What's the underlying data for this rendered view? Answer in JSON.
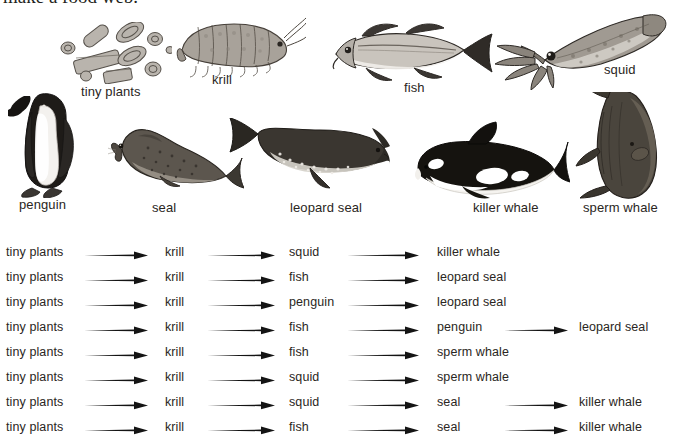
{
  "header": {
    "title": "make a food web."
  },
  "gallery": {
    "name": "antarctic-food-web-organisms",
    "items": [
      {
        "id": "tiny-plants",
        "label": "tiny plants",
        "art": "phytoplankton-diatoms-illustration"
      },
      {
        "id": "krill",
        "label": "krill",
        "art": "krill-illustration"
      },
      {
        "id": "fish",
        "label": "fish",
        "art": "fish-illustration"
      },
      {
        "id": "squid",
        "label": "squid",
        "art": "squid-illustration"
      },
      {
        "id": "penguin",
        "label": "penguin",
        "art": "penguin-illustration"
      },
      {
        "id": "seal",
        "label": "seal",
        "art": "seal-illustration"
      },
      {
        "id": "leopard-seal",
        "label": "leopard seal",
        "art": "leopard-seal-illustration"
      },
      {
        "id": "killer-whale",
        "label": "killer whale",
        "art": "killer-whale-illustration"
      },
      {
        "id": "sperm-whale",
        "label": "sperm whale",
        "art": "sperm-whale-illustration"
      }
    ]
  },
  "chains": {
    "name": "food-chain-list",
    "rows": [
      {
        "cells": [
          "tiny plants",
          "krill",
          "squid",
          "killer whale"
        ]
      },
      {
        "cells": [
          "tiny plants",
          "krill",
          "fish",
          "leopard seal"
        ]
      },
      {
        "cells": [
          "tiny plants",
          "krill",
          "penguin",
          "leopard seal"
        ]
      },
      {
        "cells": [
          "tiny plants",
          "krill",
          "fish",
          "penguin",
          "leopard seal"
        ]
      },
      {
        "cells": [
          "tiny plants",
          "krill",
          "fish",
          "sperm whale"
        ]
      },
      {
        "cells": [
          "tiny plants",
          "krill",
          "squid",
          "sperm whale"
        ]
      },
      {
        "cells": [
          "tiny plants",
          "krill",
          "squid",
          "seal",
          "killer whale"
        ]
      },
      {
        "cells": [
          "tiny plants",
          "krill",
          "fish",
          "seal",
          "killer whale"
        ]
      }
    ]
  },
  "colors": {
    "background": "#ffffff",
    "text": "#2a2622",
    "arrow": "#1a1a1a"
  }
}
